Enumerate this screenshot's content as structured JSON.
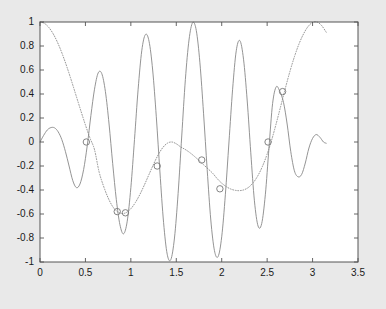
{
  "figure": {
    "background_color": "#e9e9e9",
    "axes_background_color": "#ffffff",
    "axes_edge_color": "#555555",
    "line_color": "#888888",
    "marker_edge_color": "#777777"
  },
  "chart_data": {
    "type": "line",
    "title": "",
    "xlabel": "",
    "ylabel": "",
    "xlim": [
      0,
      3.5
    ],
    "ylim": [
      -1,
      1
    ],
    "grid": false,
    "legend": null,
    "xticks": [
      0,
      0.5,
      1,
      1.5,
      2,
      2.5,
      3,
      3.5
    ],
    "xticklabels": [
      "0",
      "0.5",
      "1",
      "1.5",
      "2",
      "2.5",
      "3",
      "3.5"
    ],
    "yticks": [
      -1,
      -0.8,
      -0.6,
      -0.4,
      -0.2,
      0,
      0.2,
      0.4,
      0.6,
      0.8,
      1
    ],
    "yticklabels": [
      "-1",
      "-0.8",
      "-0.6",
      "-0.4",
      "-0.2",
      "0",
      "0.2",
      "0.4",
      "0.6",
      "0.8",
      "1"
    ],
    "series": [
      {
        "name": "envelope-curve",
        "style": "dotted",
        "x_start": 0,
        "x_end": 3.15,
        "x": [
          0.0,
          0.05,
          0.1,
          0.15,
          0.2,
          0.25,
          0.3,
          0.35,
          0.4,
          0.45,
          0.5,
          0.55,
          0.6,
          0.65,
          0.7,
          0.75,
          0.8,
          0.85,
          0.9,
          0.95,
          1.0,
          1.05,
          1.1,
          1.15,
          1.2,
          1.25,
          1.3,
          1.35,
          1.4,
          1.45,
          1.5,
          1.55,
          1.6,
          1.65,
          1.7,
          1.75,
          1.8,
          1.85,
          1.9,
          1.95,
          2.0,
          2.05,
          2.1,
          2.15,
          2.2,
          2.25,
          2.3,
          2.35,
          2.4,
          2.45,
          2.5,
          2.55,
          2.6,
          2.65,
          2.7,
          2.75,
          2.8,
          2.85,
          2.9,
          2.95,
          3.0,
          3.05,
          3.1,
          3.15
        ],
        "y": [
          1.0,
          0.988,
          0.952,
          0.895,
          0.818,
          0.724,
          0.617,
          0.501,
          0.38,
          0.259,
          0.142,
          0.033,
          -0.064,
          -0.248,
          -0.369,
          -0.466,
          -0.538,
          -0.58,
          -0.596,
          -0.588,
          -0.556,
          -0.504,
          -0.436,
          -0.356,
          -0.27,
          -0.185,
          -0.108,
          -0.048,
          -0.011,
          0.0,
          -0.015,
          -0.042,
          -0.063,
          -0.089,
          -0.12,
          -0.154,
          -0.189,
          -0.224,
          -0.26,
          -0.305,
          -0.343,
          -0.372,
          -0.392,
          -0.403,
          -0.405,
          -0.397,
          -0.375,
          -0.336,
          -0.278,
          -0.2,
          -0.101,
          0.018,
          0.154,
          0.3,
          0.447,
          0.586,
          0.71,
          0.816,
          0.9,
          0.962,
          0.996,
          1.0,
          0.97,
          0.915
        ]
      },
      {
        "name": "oscillating-curve",
        "style": "solid",
        "x_start": 0,
        "x_end": 3.15,
        "x": [
          0.0,
          0.04,
          0.08,
          0.12,
          0.16,
          0.2,
          0.24,
          0.28,
          0.32,
          0.36,
          0.4,
          0.44,
          0.48,
          0.52,
          0.56,
          0.6,
          0.64,
          0.68,
          0.72,
          0.76,
          0.8,
          0.84,
          0.88,
          0.92,
          0.96,
          1.0,
          1.04,
          1.08,
          1.12,
          1.16,
          1.2,
          1.24,
          1.28,
          1.32,
          1.36,
          1.4,
          1.44,
          1.48,
          1.52,
          1.56,
          1.6,
          1.64,
          1.68,
          1.72,
          1.76,
          1.8,
          1.84,
          1.88,
          1.92,
          1.96,
          2.0,
          2.04,
          2.08,
          2.12,
          2.16,
          2.2,
          2.24,
          2.28,
          2.32,
          2.36,
          2.4,
          2.44,
          2.48,
          2.52,
          2.56,
          2.6,
          2.64,
          2.68,
          2.72,
          2.76,
          2.8,
          2.84,
          2.88,
          2.92,
          2.96,
          3.0,
          3.04,
          3.08,
          3.12,
          3.15
        ],
        "y": [
          0.0,
          0.055,
          0.1,
          0.12,
          0.118,
          0.085,
          0.02,
          -0.08,
          -0.2,
          -0.32,
          -0.38,
          -0.35,
          -0.23,
          -0.03,
          0.22,
          0.44,
          0.575,
          0.57,
          0.42,
          0.15,
          -0.18,
          -0.48,
          -0.69,
          -0.765,
          -0.66,
          -0.38,
          0.02,
          0.44,
          0.76,
          0.895,
          0.84,
          0.6,
          0.21,
          -0.25,
          -0.67,
          -0.935,
          -0.98,
          -0.8,
          -0.43,
          0.05,
          0.52,
          0.85,
          0.995,
          0.93,
          0.66,
          0.24,
          -0.23,
          -0.65,
          -0.905,
          -0.955,
          -0.79,
          -0.44,
          0.0,
          0.44,
          0.76,
          0.845,
          0.69,
          0.35,
          -0.09,
          -0.49,
          -0.7,
          -0.68,
          -0.44,
          -0.05,
          0.32,
          0.46,
          0.42,
          0.33,
          0.15,
          -0.08,
          -0.24,
          -0.29,
          -0.27,
          -0.175,
          -0.05,
          0.03,
          0.062,
          0.04,
          0.0,
          -0.01
        ]
      }
    ],
    "markers": [
      {
        "label": "intersection-1",
        "x": 0.51,
        "y": 0.0
      },
      {
        "label": "intersection-2",
        "x": 0.85,
        "y": -0.58
      },
      {
        "label": "intersection-3",
        "x": 0.94,
        "y": -0.59
      },
      {
        "label": "intersection-4",
        "x": 1.29,
        "y": -0.2
      },
      {
        "label": "intersection-5",
        "x": 1.78,
        "y": -0.15
      },
      {
        "label": "intersection-6",
        "x": 1.98,
        "y": -0.39
      },
      {
        "label": "intersection-7",
        "x": 2.51,
        "y": 0.0
      },
      {
        "label": "intersection-8",
        "x": 2.67,
        "y": 0.42
      }
    ]
  }
}
